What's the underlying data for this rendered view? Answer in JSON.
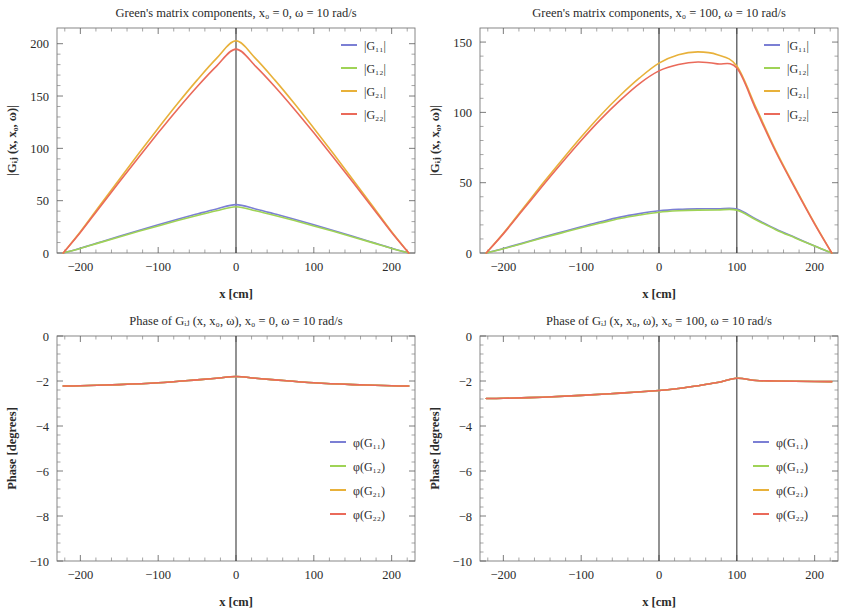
{
  "figure": {
    "width": 846,
    "height": 616,
    "background": "#ffffff"
  },
  "series_colors": {
    "G11": "#7b7fd4",
    "G12": "#9fd356",
    "G21": "#e8b13a",
    "G22": "#ea6a5a"
  },
  "panels": [
    {
      "id": "magnitude-x0-0",
      "title": "Green's matrix components, x₀ = 0, ω = 10 rad/s",
      "xlabel": "x [cm]",
      "ylabel": "|Gᵢⱼ (x, x₀, ω)|",
      "legend": [
        "|G₁₁|",
        "|G₁₂|",
        "|G₂₁|",
        "|G₂₂|"
      ],
      "xticks": [
        -200,
        -100,
        0,
        100,
        200
      ],
      "yticks": [
        0,
        50,
        100,
        150,
        200
      ],
      "xlim": [
        -230,
        230
      ],
      "ylim": [
        0,
        215
      ],
      "vlines": [
        0
      ]
    },
    {
      "id": "magnitude-x0-100",
      "title": "Green's matrix components, x₀ = 100, ω = 10 rad/s",
      "xlabel": "x [cm]",
      "ylabel": "|Gᵢⱼ (x, x₀, ω)|",
      "legend": [
        "|G₁₁|",
        "|G₁₂|",
        "|G₂₁|",
        "|G₂₂|"
      ],
      "xticks": [
        -200,
        -100,
        0,
        100,
        200
      ],
      "yticks": [
        0,
        50,
        100,
        150
      ],
      "xlim": [
        -230,
        230
      ],
      "ylim": [
        0,
        160
      ],
      "vlines": [
        0,
        100
      ]
    },
    {
      "id": "phase-x0-0",
      "title": "Phase of Gᵢⱼ (x, x₀, ω), x₀ = 0, ω = 10 rad/s",
      "xlabel": "x [cm]",
      "ylabel": "Phase [degrees]",
      "legend": [
        "φ(G₁₁)",
        "φ(G₁₂)",
        "φ(G₂₁)",
        "φ(G₂₂)"
      ],
      "xticks": [
        -200,
        -100,
        0,
        100,
        200
      ],
      "yticks": [
        0,
        -2,
        -4,
        -6,
        -8,
        -10
      ],
      "xlim": [
        -230,
        230
      ],
      "ylim": [
        -10,
        0
      ],
      "vlines": [
        0
      ]
    },
    {
      "id": "phase-x0-100",
      "title": "Phase of Gᵢⱼ (x, x₀, ω), x₀ = 100, ω = 10 rad/s",
      "xlabel": "x [cm]",
      "ylabel": "Phase [degrees]",
      "legend": [
        "φ(G₁₁)",
        "φ(G₁₂)",
        "φ(G₂₁)",
        "φ(G₂₂)"
      ],
      "xticks": [
        -200,
        -100,
        0,
        100,
        200
      ],
      "yticks": [
        0,
        -2,
        -4,
        -6,
        -8,
        -10
      ],
      "xlim": [
        -230,
        230
      ],
      "ylim": [
        -10,
        0
      ],
      "vlines": [
        0,
        100
      ]
    }
  ],
  "chart_data": [
    {
      "type": "line",
      "panel": "magnitude-x0-0",
      "title": "Green's matrix components, x0 = 0, omega = 10 rad/s",
      "xlabel": "x [cm]",
      "ylabel": "|G_ij (x, x0, omega)|",
      "xlim": [
        -230,
        230
      ],
      "ylim": [
        0,
        215
      ],
      "grid": false,
      "legend_position": "top-right",
      "x": [
        -222,
        -200,
        -175,
        -150,
        -125,
        -100,
        -75,
        -50,
        -25,
        0,
        25,
        50,
        75,
        100,
        125,
        150,
        175,
        200,
        222
      ],
      "series": [
        {
          "name": "|G11|",
          "color": "#7b7fd4",
          "values": [
            0,
            4.6,
            10.3,
            16.0,
            21.6,
            27.0,
            32.3,
            37.3,
            42.1,
            46.2,
            42.1,
            37.3,
            32.3,
            27.0,
            21.6,
            16.0,
            10.3,
            4.6,
            0
          ]
        },
        {
          "name": "|G12|",
          "color": "#9fd356",
          "values": [
            0,
            4.4,
            9.9,
            15.3,
            20.7,
            25.9,
            31.0,
            35.8,
            40.3,
            44.2,
            40.3,
            35.8,
            31.0,
            25.9,
            20.7,
            15.3,
            9.9,
            4.4,
            0
          ]
        },
        {
          "name": "|G21|",
          "color": "#e8b13a",
          "values": [
            0,
            20.3,
            45.4,
            70.3,
            95.0,
            119.2,
            142.8,
            165.2,
            186.0,
            202.8,
            186.0,
            165.2,
            142.8,
            119.2,
            95.0,
            70.3,
            45.4,
            20.3,
            0
          ]
        },
        {
          "name": "|G22|",
          "color": "#ea6a5a",
          "values": [
            0,
            19.6,
            43.8,
            67.8,
            91.5,
            114.8,
            137.4,
            158.9,
            178.6,
            194.8,
            178.6,
            158.9,
            137.4,
            114.8,
            91.5,
            67.8,
            43.8,
            19.6,
            0
          ]
        }
      ],
      "annotations": [
        "vertical line at x = 0"
      ]
    },
    {
      "type": "line",
      "panel": "magnitude-x0-100",
      "title": "Green's matrix components, x0 = 100, omega = 10 rad/s",
      "xlabel": "x [cm]",
      "ylabel": "|G_ij (x, x0, omega)|",
      "xlim": [
        -230,
        230
      ],
      "ylim": [
        0,
        160
      ],
      "grid": false,
      "legend_position": "top-right",
      "x": [
        -222,
        -200,
        -175,
        -150,
        -125,
        -100,
        -75,
        -50,
        -25,
        0,
        25,
        50,
        75,
        100,
        125,
        150,
        175,
        200,
        222
      ],
      "series": [
        {
          "name": "|G11|",
          "color": "#7b7fd4",
          "values": [
            0,
            3.2,
            7.1,
            11.1,
            14.9,
            18.6,
            22.2,
            25.5,
            28.0,
            30.0,
            31.0,
            31.4,
            31.4,
            31.2,
            24.0,
            17.0,
            11.0,
            5.0,
            0
          ]
        },
        {
          "name": "|G12|",
          "color": "#9fd356",
          "values": [
            0,
            3.0,
            6.8,
            10.6,
            14.3,
            17.9,
            21.3,
            24.5,
            27.0,
            29.0,
            30.0,
            30.5,
            30.6,
            30.5,
            23.4,
            16.6,
            10.7,
            4.9,
            0
          ]
        },
        {
          "name": "|G21|",
          "color": "#e8b13a",
          "values": [
            0,
            14.0,
            31.5,
            49.0,
            66.0,
            82.5,
            98.0,
            112.0,
            124.5,
            135.0,
            141.0,
            143.0,
            141.0,
            133.0,
            103.0,
            73.0,
            46.5,
            21.0,
            0
          ]
        },
        {
          "name": "|G22|",
          "color": "#ea6a5a",
          "values": [
            0,
            13.6,
            30.5,
            47.5,
            64.0,
            80.0,
            95.0,
            108.5,
            120.5,
            129.5,
            134.0,
            135.8,
            134.5,
            131.5,
            101.5,
            72.0,
            45.8,
            20.6,
            0
          ]
        }
      ],
      "annotations": [
        "vertical line at x = 0",
        "vertical line at x = 100"
      ]
    },
    {
      "type": "line",
      "panel": "phase-x0-0",
      "title": "Phase of G_ij (x, x0, omega), x0 = 0, omega = 10 rad/s",
      "xlabel": "x [cm]",
      "ylabel": "Phase [degrees]",
      "xlim": [
        -230,
        230
      ],
      "ylim": [
        -10,
        0
      ],
      "grid": false,
      "legend_position": "middle-right",
      "x": [
        -222,
        -200,
        -150,
        -100,
        -50,
        -25,
        0,
        25,
        50,
        100,
        150,
        200,
        222
      ],
      "series": [
        {
          "name": "phi(G11)",
          "color": "#7b7fd4",
          "values": [
            -2.22,
            -2.21,
            -2.16,
            -2.08,
            -1.95,
            -1.88,
            -1.8,
            -1.88,
            -1.95,
            -2.08,
            -2.16,
            -2.21,
            -2.22
          ]
        },
        {
          "name": "phi(G12)",
          "color": "#9fd356",
          "values": [
            -2.22,
            -2.21,
            -2.16,
            -2.08,
            -1.95,
            -1.88,
            -1.8,
            -1.88,
            -1.95,
            -2.08,
            -2.16,
            -2.21,
            -2.22
          ]
        },
        {
          "name": "phi(G21)",
          "color": "#e8b13a",
          "values": [
            -2.22,
            -2.21,
            -2.16,
            -2.08,
            -1.95,
            -1.88,
            -1.8,
            -1.88,
            -1.95,
            -2.08,
            -2.16,
            -2.21,
            -2.22
          ]
        },
        {
          "name": "phi(G22)",
          "color": "#ea6a5a",
          "values": [
            -2.22,
            -2.21,
            -2.16,
            -2.08,
            -1.95,
            -1.88,
            -1.8,
            -1.88,
            -1.95,
            -2.08,
            -2.16,
            -2.21,
            -2.22
          ]
        }
      ],
      "annotations": [
        "vertical line at x = 0",
        "all four phase curves overlap"
      ]
    },
    {
      "type": "line",
      "panel": "phase-x0-100",
      "title": "Phase of G_ij (x, x0, omega), x0 = 100, omega = 10 rad/s",
      "xlabel": "x [cm]",
      "ylabel": "Phase [degrees]",
      "xlim": [
        -230,
        230
      ],
      "ylim": [
        -10,
        0
      ],
      "grid": false,
      "legend_position": "middle-right",
      "x": [
        -222,
        -200,
        -150,
        -100,
        -50,
        0,
        25,
        50,
        75,
        100,
        125,
        150,
        200,
        222
      ],
      "series": [
        {
          "name": "phi(G11)",
          "color": "#7b7fd4",
          "values": [
            -2.78,
            -2.77,
            -2.72,
            -2.64,
            -2.54,
            -2.42,
            -2.33,
            -2.21,
            -2.07,
            -1.88,
            -1.98,
            -2.0,
            -2.02,
            -2.03
          ]
        },
        {
          "name": "phi(G12)",
          "color": "#9fd356",
          "values": [
            -2.78,
            -2.77,
            -2.72,
            -2.64,
            -2.54,
            -2.42,
            -2.33,
            -2.21,
            -2.07,
            -1.88,
            -1.98,
            -2.0,
            -2.02,
            -2.03
          ]
        },
        {
          "name": "phi(G21)",
          "color": "#e8b13a",
          "values": [
            -2.78,
            -2.77,
            -2.72,
            -2.64,
            -2.54,
            -2.42,
            -2.33,
            -2.21,
            -2.07,
            -1.88,
            -1.98,
            -2.0,
            -2.02,
            -2.03
          ]
        },
        {
          "name": "phi(G22)",
          "color": "#ea6a5a",
          "values": [
            -2.78,
            -2.77,
            -2.72,
            -2.64,
            -2.54,
            -2.42,
            -2.33,
            -2.21,
            -2.07,
            -1.88,
            -1.98,
            -2.0,
            -2.02,
            -2.03
          ]
        }
      ],
      "annotations": [
        "vertical line at x = 0",
        "vertical line at x = 100",
        "all four phase curves overlap"
      ]
    }
  ]
}
